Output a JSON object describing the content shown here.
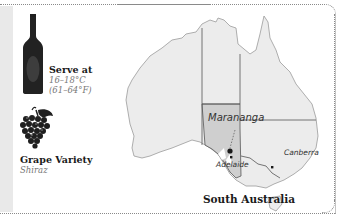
{
  "serve": {
    "title": "Serve at",
    "celsius": "16–18°C",
    "fahrenheit": "(61–64°F)"
  },
  "grape": {
    "title": "Grape Variety",
    "value": "Shiraz"
  },
  "map": {
    "region_title": "South Australia",
    "labels": {
      "subregion": "Marananga",
      "city_1": "Adelaide",
      "city_2": "Canberra"
    },
    "colors": {
      "land": "#ececec",
      "highlight": "#cfcfcf",
      "border": "#555555",
      "dot": "#1a1a1a"
    }
  },
  "icons": {
    "bottle": "wine-bottle-icon",
    "grapes": "grapes-icon"
  }
}
